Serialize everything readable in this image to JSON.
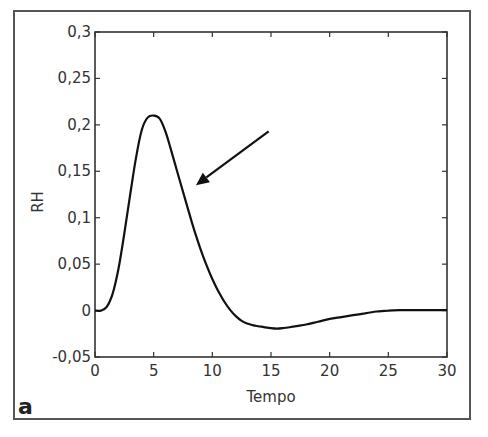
{
  "panel_label": "a",
  "chart_data": {
    "type": "line",
    "title": "",
    "xlabel": "Tempo",
    "ylabel": "RH",
    "xlim": [
      0,
      30
    ],
    "ylim": [
      -0.05,
      0.3
    ],
    "xticks": [
      0,
      5,
      10,
      15,
      20,
      25,
      30
    ],
    "xtick_labels": [
      "0",
      "5",
      "10",
      "15",
      "20",
      "25",
      "30"
    ],
    "yticks": [
      -0.05,
      0,
      0.05,
      0.1,
      0.15,
      0.2,
      0.25,
      0.3
    ],
    "ytick_labels": [
      "-0,05",
      "0",
      "0,05",
      "0,1",
      "0,15",
      "0,2",
      "0,25",
      "0,3"
    ],
    "grid": false,
    "legend": null,
    "series": [
      {
        "name": "RH",
        "x": [
          0,
          0.5,
          1,
          1.5,
          2,
          2.5,
          3,
          3.5,
          4,
          4.5,
          5,
          5.5,
          6,
          6.5,
          7,
          7.5,
          8,
          8.5,
          9,
          9.5,
          10,
          10.5,
          11,
          11.5,
          12,
          12.5,
          13,
          13.5,
          14,
          15,
          15.5,
          16,
          17,
          18,
          19,
          20,
          21,
          22,
          23,
          24,
          25,
          26,
          27,
          28,
          29,
          30
        ],
        "values": [
          0,
          0,
          0.004,
          0.018,
          0.045,
          0.083,
          0.125,
          0.165,
          0.195,
          0.208,
          0.21,
          0.207,
          0.193,
          0.172,
          0.15,
          0.128,
          0.106,
          0.085,
          0.066,
          0.049,
          0.034,
          0.021,
          0.01,
          0.001,
          -0.006,
          -0.011,
          -0.014,
          -0.016,
          -0.017,
          -0.019,
          -0.0195,
          -0.019,
          -0.017,
          -0.015,
          -0.012,
          -0.009,
          -0.007,
          -0.005,
          -0.003,
          -0.001,
          0,
          0.0005,
          0.0005,
          0.0005,
          0.0005,
          0.0005
        ]
      }
    ],
    "annotations": [
      {
        "type": "arrow",
        "from": [
          14.8,
          0.193
        ],
        "to": [
          8.6,
          0.135
        ],
        "text": ""
      }
    ]
  }
}
